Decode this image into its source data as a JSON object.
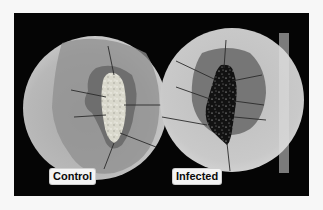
{
  "figure": {
    "panels": [
      {
        "id": "control",
        "label": "Control",
        "description": "Petri dish with pale, fragmented tissue pinned in center on gray agar zone"
      },
      {
        "id": "infected",
        "label": "Infected",
        "description": "Petri dish with dark, blackened tissue pinned in center, surrounded by dark halo"
      }
    ],
    "colors": {
      "frame_background": "#050505",
      "page_background": "#f7f7f7",
      "dish_light": "#c9c9c9",
      "halo_control": "#8a8a8a",
      "halo_infected": "#6f6f6f",
      "tissue_control": "#cfcfc4",
      "tissue_infected": "#141414",
      "label_background": "#f4f4f4",
      "label_text": "#0a0a0a"
    }
  }
}
